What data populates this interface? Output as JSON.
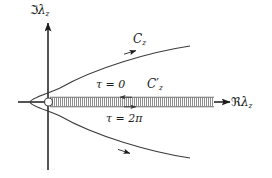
{
  "figure": {
    "kind": "complex-plane-contour-diagram",
    "background_color": "#ffffff",
    "ink_color": "#1b1b1b",
    "width": 272,
    "height": 178
  },
  "labels": {
    "imaginary_axis": {
      "symbol": "ℑ",
      "variable": "λ",
      "subscript": "z"
    },
    "real_axis": {
      "symbol": "ℜ",
      "variable": "λ",
      "subscript": "z"
    },
    "contour_outer": {
      "variable": "C",
      "subscript": "z",
      "prime": ""
    },
    "contour_inner": {
      "variable": "C",
      "subscript": "z",
      "prime": "′"
    },
    "tau_top": "τ = 0",
    "tau_bottom": "τ = 2π"
  },
  "axes": {
    "origin": {
      "x": 48,
      "y": 102
    },
    "vertical": {
      "x": 48,
      "y_top": 20,
      "y_bottom": 170,
      "arrow": "up"
    },
    "horizontal": {
      "y": 102,
      "x_left": 18,
      "x_right": 232,
      "arrow": "right"
    }
  },
  "contour_outer_path": {
    "type": "parabola",
    "vertex": {
      "x": 30,
      "y": 102
    },
    "upper_end": {
      "x": 190,
      "y": 46
    },
    "lower_end": {
      "x": 190,
      "y": 158
    },
    "direction_arrows": [
      {
        "x": 132,
        "y": 51,
        "dir": "up-right"
      },
      {
        "x": 126,
        "y": 153,
        "dir": "down-right"
      }
    ]
  },
  "branch_cut": {
    "style": "hatched-band",
    "start": {
      "x": 49,
      "y": 102
    },
    "end": {
      "x": 214,
      "y": 102
    },
    "half_height": 5,
    "hatch_spacing": 2,
    "open_circle_at_start": {
      "x": 48,
      "y": 102,
      "r": 4
    },
    "top_edge_arrow": {
      "x": 124,
      "y": 96,
      "dir": "left"
    },
    "bottom_edge_arrow": {
      "x": 134,
      "y": 108,
      "dir": "right"
    }
  }
}
